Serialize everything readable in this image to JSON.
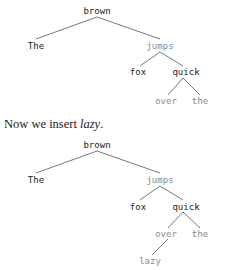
{
  "tree1": {
    "nodes": {
      "brown": "brown",
      "the_cap": "The",
      "jumps": "jumps",
      "fox": "fox",
      "quick": "quick",
      "over": "over",
      "the": "the"
    }
  },
  "caption": {
    "prefix": "Now we insert ",
    "emphasis": "lazy",
    "suffix": "."
  },
  "tree2": {
    "nodes": {
      "brown": "brown",
      "the_cap": "The",
      "jumps": "jumps",
      "fox": "fox",
      "quick": "quick",
      "over": "over",
      "the": "the",
      "lazy": "lazy"
    }
  }
}
